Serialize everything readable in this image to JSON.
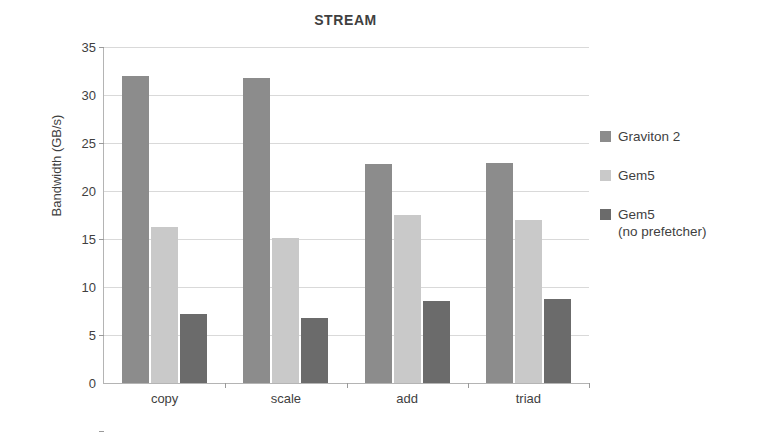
{
  "chart_data": {
    "type": "bar",
    "title": "STREAM",
    "xlabel": "",
    "ylabel": "Bandwidth (GB/s)",
    "categories": [
      "copy",
      "scale",
      "add",
      "triad"
    ],
    "series": [
      {
        "name": "Graviton 2",
        "color": "#8c8c8c",
        "values": [
          32.0,
          31.8,
          22.8,
          22.9
        ]
      },
      {
        "name": "Gem5",
        "color": "#c9c9c9",
        "values": [
          16.3,
          15.1,
          17.5,
          17.0
        ]
      },
      {
        "name": "Gem5\n(no prefetcher)",
        "color": "#6b6b6b",
        "values": [
          7.2,
          6.8,
          8.5,
          8.8
        ]
      }
    ],
    "ylim": [
      0,
      35
    ],
    "ytick_step": 5,
    "yticks": [
      0,
      5,
      10,
      15,
      20,
      25,
      30,
      35
    ],
    "ytick_labels": [
      "0",
      "5",
      "10",
      "15",
      "20",
      "25",
      "30",
      "35"
    ],
    "grid": true,
    "grid_axis": "y",
    "legend_position": "right",
    "legend_entries": [
      "Graviton 2",
      "Gem5",
      "Gem5\n(no prefetcher)"
    ],
    "background_color": "#ffffff",
    "axis_color": "#b4b4b4",
    "gridline_color": "#d9d9d9",
    "text_color": "#3f3f3f"
  }
}
